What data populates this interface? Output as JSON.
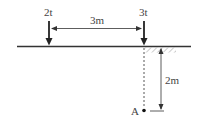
{
  "diagram": {
    "loads": [
      {
        "label": "2t",
        "x": 49
      },
      {
        "label": "3t",
        "x": 144
      }
    ],
    "horizontal_dimension": {
      "label": "3m"
    },
    "vertical_dimension": {
      "label": "2m"
    },
    "point": {
      "label": "A"
    },
    "colors": {
      "line": "#333333",
      "text": "#444444",
      "hatch": "#999999",
      "background": "#ffffff"
    }
  }
}
